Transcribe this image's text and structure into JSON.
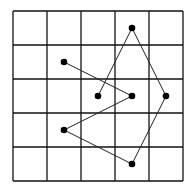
{
  "grid": {
    "cols": 5,
    "rows": 5,
    "origin_x": 13,
    "origin_y": 11,
    "cell": 34,
    "line_color": "#111111"
  },
  "points": [
    {
      "col": 1,
      "row": 1
    },
    {
      "col": 3,
      "row": 2
    },
    {
      "col": 1,
      "row": 3
    },
    {
      "col": 3,
      "row": 4
    },
    {
      "col": 4,
      "row": 2
    },
    {
      "col": 3,
      "row": 0
    },
    {
      "col": 2,
      "row": 2
    }
  ],
  "path_order": [
    0,
    1,
    2,
    3,
    4,
    5,
    6
  ],
  "dot_color": "#000000"
}
